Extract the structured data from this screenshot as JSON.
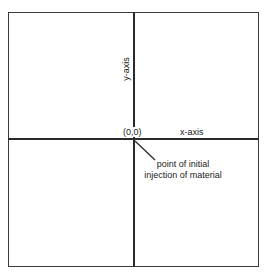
{
  "diagram": {
    "title": "",
    "origin_label": "(0,0)",
    "x_axis_label": "x-axis",
    "y_axis_label": "y-axis",
    "annotation": {
      "line1": "point of initial",
      "line2": "injection of material",
      "points_to": "origin"
    },
    "colors": {
      "line": "#2a2a2a",
      "text": "#222222",
      "background": "#ffffff"
    }
  }
}
